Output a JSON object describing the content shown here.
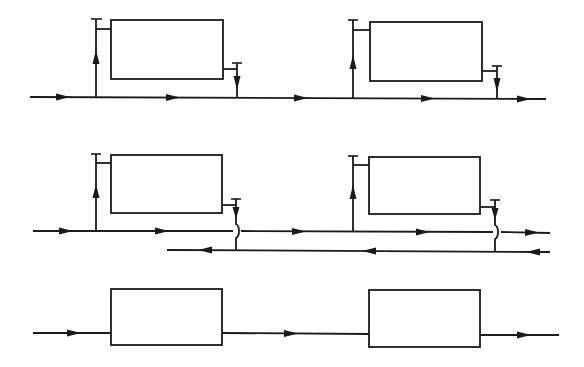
{
  "diagram": {
    "type": "heating-system-piping-schematics",
    "colors": {
      "line": "#1a1a1a",
      "background": "#ffffff"
    },
    "rows": [
      {
        "id": "single-pipe-system",
        "description": "Single-pipe loop: supply line with radiators tapped in parallel via riser and return drop",
        "radiators": 2,
        "flow_direction": "left-to-right"
      },
      {
        "id": "two-pipe-reverse-return",
        "description": "Two-pipe system: supply line left-to-right, return line right-to-left with crossover",
        "radiators": 2,
        "flow_direction": [
          "supply: left-to-right",
          "return: right-to-left"
        ]
      },
      {
        "id": "series-loop-system",
        "description": "Series loop: flow passes directly through each radiator in sequence",
        "radiators": 2,
        "flow_direction": "left-to-right"
      }
    ]
  }
}
